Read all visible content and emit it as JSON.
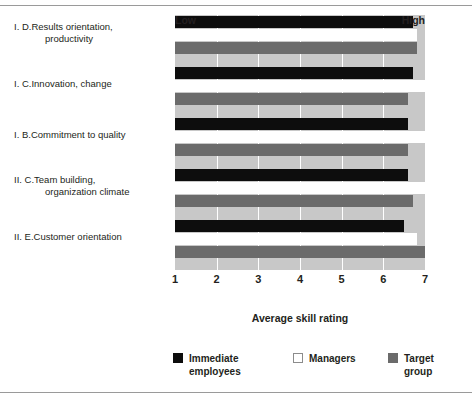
{
  "figure": {
    "top_rule": true,
    "bottom_rule": true
  },
  "chart_data": {
    "type": "bar",
    "orientation": "horizontal",
    "title": "",
    "xlabel": "Average skill rating",
    "ylabel": "",
    "xlim": [
      1,
      7
    ],
    "xticks": [
      "1",
      "2",
      "3",
      "4",
      "5",
      "6",
      "7"
    ],
    "axis_endcaps": {
      "low": "Low",
      "high": "High"
    },
    "grid": true,
    "grid_color": "#ffffff",
    "plot_background": "#c8c8c8",
    "legend_position": "bottom",
    "categories": [
      "I.  D.  Results orientation, productivity",
      "I.  C.  Innovation, change",
      "I.  B.  Commitment to quality",
      "II.  C.  Team building, organization climate",
      "II.  E.  Customer orientation"
    ],
    "category_parts": [
      {
        "num": "I.  D.",
        "line1": "Results orientation,",
        "line2": "productivity"
      },
      {
        "num": "I.  C.",
        "line1": "Innovation, change",
        "line2": ""
      },
      {
        "num": "I.  B.",
        "line1": "Commitment to quality",
        "line2": ""
      },
      {
        "num": "II.  C.",
        "line1": "Team building,",
        "line2": "organization climate"
      },
      {
        "num": "II.  E.",
        "line1": "Customer orientation",
        "line2": ""
      }
    ],
    "series": [
      {
        "name": "Immediate employees",
        "color": "#0d0d0d",
        "values": [
          6.7,
          6.7,
          6.6,
          6.6,
          6.5
        ]
      },
      {
        "name": "Managers",
        "color": "#ffffff",
        "values": [
          6.8,
          7.0,
          7.0,
          7.0,
          6.8
        ]
      },
      {
        "name": "Target group",
        "color": "#6b6b6b",
        "values": [
          6.8,
          6.6,
          6.6,
          6.7,
          7.0
        ]
      }
    ]
  },
  "legend": {
    "items": [
      {
        "label": "Immediate\nemployees",
        "swatch": "black"
      },
      {
        "label": "Managers",
        "swatch": "white"
      },
      {
        "label": "Target group",
        "swatch": "gray"
      }
    ]
  }
}
